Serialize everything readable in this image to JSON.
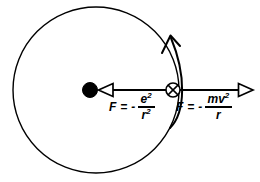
{
  "figure": {
    "background_color": "#ffffff",
    "stroke_color": "#000000",
    "width": 260,
    "height": 182
  },
  "orbit": {
    "name": "electron-orbit-circle",
    "center_x": 96,
    "center_y": 90,
    "radius": 83,
    "stroke_width": 1.4
  },
  "nucleus": {
    "name": "nucleus",
    "x": 90,
    "y": 90,
    "radius": 7.5,
    "fill": "#000000"
  },
  "electron": {
    "name": "electron",
    "x": 173,
    "y": 90,
    "radius": 7,
    "fill": "#ffffff",
    "marker": "crossed-circle"
  },
  "arrows": {
    "coulomb": {
      "name": "coulomb-force-arrow",
      "direction": "left",
      "tail_x": 173,
      "tail_y": 90,
      "head_x": 99,
      "head_y": 90,
      "head_style": "open-triangle"
    },
    "centripetal": {
      "name": "centripetal-force-arrow",
      "direction": "right",
      "tail_x": 173,
      "tail_y": 90,
      "head_x": 252,
      "head_y": 90,
      "head_style": "open-triangle"
    },
    "velocity": {
      "name": "velocity-curved-arrow",
      "direction": "counterclockwise-up",
      "head_style": "open-vee"
    }
  },
  "labels": {
    "coulomb_force": {
      "name": "coulomb-force-label",
      "lead": "F = -",
      "numerator": "e",
      "numerator_exponent": "2",
      "denominator": "r",
      "denominator_exponent": "2",
      "full_text": "F = - e²/r²"
    },
    "centripetal_force": {
      "name": "centripetal-force-label",
      "lead": "F = -",
      "numerator": "mv",
      "numerator_exponent": "2",
      "denominator": "r",
      "denominator_exponent": "",
      "full_text": "F = - mv²/r"
    }
  }
}
